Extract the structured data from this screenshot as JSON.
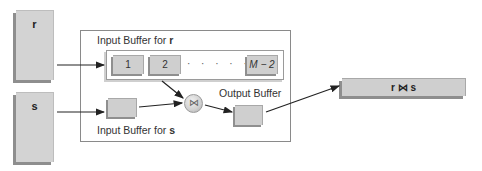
{
  "diagram": {
    "type": "block-nested-loop-join-buffers",
    "relations": {
      "r": {
        "label": "r"
      },
      "s": {
        "label": "s"
      }
    },
    "input_buffer_r": {
      "label_prefix": "Input Buffer for ",
      "label_relation": "r",
      "blocks": [
        "1",
        "2",
        "M − 2"
      ],
      "ellipsis": "· · · · · ·"
    },
    "input_buffer_s": {
      "label_prefix": "Input Buffer for ",
      "label_relation": "s"
    },
    "join_operator": {
      "symbol": "⋈",
      "icon": "bowtie-join-icon"
    },
    "output_buffer": {
      "label": "Output Buffer"
    },
    "result": {
      "label": "r ⋈ s"
    },
    "edges": [
      {
        "from": "r",
        "to": "input_buffer_r"
      },
      {
        "from": "s",
        "to": "input_buffer_s"
      },
      {
        "from": "input_buffer_r",
        "to": "join_operator"
      },
      {
        "from": "input_buffer_s",
        "to": "join_operator"
      },
      {
        "from": "join_operator",
        "to": "output_buffer"
      },
      {
        "from": "output_buffer",
        "to": "result"
      }
    ],
    "colors": {
      "block_fill": "#cfcfcf",
      "block_shadow": "#8e8e8e",
      "border": "#8a8a8a",
      "arrow": "#222222"
    }
  }
}
